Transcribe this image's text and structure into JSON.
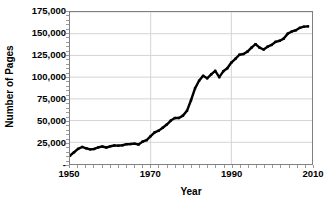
{
  "chart_data": {
    "type": "line",
    "title": "",
    "xlabel": "Year",
    "ylabel": "Number of Pages",
    "xlim": [
      1950,
      2010
    ],
    "ylim": [
      0,
      175000
    ],
    "grid": true,
    "legend": "none",
    "y_ticks": [
      175000,
      150000,
      125000,
      100000,
      75000,
      50000,
      25000,
      0
    ],
    "y_tick_labels": [
      "175,000",
      "150,000",
      "125,000",
      "100,000",
      "75,000",
      "50,000",
      "25,000",
      "-"
    ],
    "x_ticks": [
      1950,
      1970,
      1990,
      2010
    ],
    "x_tick_labels": [
      "1950",
      "1970",
      "1990",
      "2010"
    ],
    "x_minor_tick_step": 2,
    "y_minor_tick_step": 5000,
    "series": [
      {
        "name": "Number of Pages",
        "color": "#000000",
        "marker": "square",
        "x": [
          1950,
          1951,
          1952,
          1953,
          1954,
          1955,
          1956,
          1957,
          1958,
          1959,
          1960,
          1961,
          1962,
          1963,
          1964,
          1965,
          1966,
          1967,
          1968,
          1969,
          1970,
          1971,
          1972,
          1973,
          1974,
          1975,
          1976,
          1977,
          1978,
          1979,
          1980,
          1981,
          1982,
          1983,
          1984,
          1985,
          1986,
          1987,
          1988,
          1989,
          1990,
          1991,
          1992,
          1993,
          1994,
          1995,
          1996,
          1997,
          1998,
          1999,
          2000,
          2001,
          2002,
          2003,
          2004,
          2005,
          2006,
          2007,
          2008,
          2009
        ],
        "values": [
          9600,
          13500,
          17400,
          19600,
          18100,
          16900,
          17300,
          19100,
          20100,
          19000,
          20400,
          21300,
          21100,
          21600,
          22800,
          23000,
          23400,
          22400,
          25800,
          27500,
          32100,
          36500,
          38400,
          41800,
          45400,
          50000,
          52900,
          53000,
          55700,
          61200,
          73400,
          87100,
          95800,
          101500,
          98700,
          103200,
          107200,
          100000,
          106700,
          110200,
          116800,
          121000,
          125800,
          126600,
          129400,
          133900,
          138000,
          133900,
          131800,
          135100,
          137100,
          140700,
          141900,
          144400,
          150100,
          152600,
          154000,
          156800,
          158100,
          158500
        ],
        "start_value": 9600,
        "end_value": 158500,
        "min_value": 9600,
        "max_value": 158500
      }
    ],
    "style": {
      "background": "#ffffff",
      "grid_color": "#d4d4d4",
      "axis_border_color": "#808080",
      "line_color": "#000000",
      "line_width": 2.4,
      "marker_size": 2.4,
      "text_color": "#000000"
    }
  }
}
